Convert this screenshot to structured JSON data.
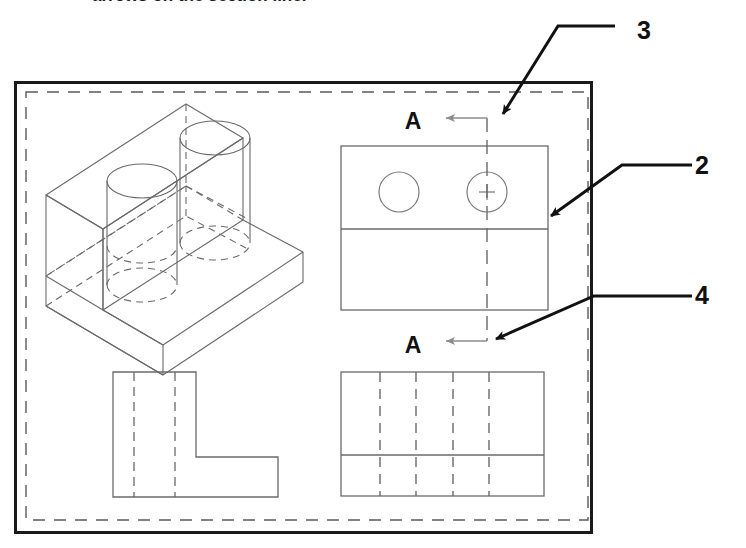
{
  "caption": {
    "text": "arrows on the section line."
  },
  "frame": {
    "outer": {
      "x": 14,
      "y": 81,
      "width": 578,
      "height": 452,
      "stroke": "#1a1a1a",
      "stroke_width": 3
    },
    "inner_dashed": {
      "x": 26,
      "y": 92,
      "width": 562,
      "height": 428,
      "stroke": "#555555",
      "stroke_width": 1.4,
      "dash": "11 9"
    }
  },
  "colors": {
    "heavy_line": "#111111",
    "thin_line": "#6a6a6a",
    "hidden_line": "#6a6a6a",
    "center_line": "#6a6a6a",
    "background": "#ffffff"
  },
  "callouts": [
    {
      "id": "callout-3",
      "label": "3",
      "label_x": 644,
      "label_y": 39,
      "horiz_x1": 615,
      "horiz_x2": 558,
      "horiz_y": 26,
      "diag_x": 499,
      "diag_y": 118,
      "arrow": "down-left"
    },
    {
      "id": "callout-2",
      "label": "2",
      "label_x": 700,
      "label_y": 172,
      "horiz_x1": 692,
      "horiz_x2": 622,
      "horiz_y": 165,
      "diag_x": 547,
      "diag_y": 219,
      "arrow": "down-left"
    },
    {
      "id": "callout-4",
      "label": "4",
      "label_x": 700,
      "label_y": 302,
      "horiz_x1": 692,
      "horiz_x2": 594,
      "horiz_y": 296,
      "diag_x": 492,
      "diag_y": 341,
      "arrow": "down-left"
    }
  ],
  "views": {
    "isometric": {
      "name": "isometric-pictorial-view",
      "description": "L-shaped bracket with two vertical through holes"
    },
    "top_view": {
      "name": "top-view-with-holes",
      "rect": {
        "x": 341,
        "y": 146,
        "width": 207,
        "height": 164
      },
      "divider_y": 229,
      "circles": [
        {
          "cx": 399,
          "cy": 192,
          "r": 20,
          "center_mark": false
        },
        {
          "cx": 487,
          "cy": 192,
          "r": 20,
          "center_mark": true
        }
      ]
    },
    "side_view": {
      "name": "l-shaped-side-view",
      "hidden_lines": 2
    },
    "front_view": {
      "name": "front-view-sectioned",
      "rect": {
        "x": 341,
        "y": 372,
        "width": 203,
        "height": 124
      },
      "divider_y": 455,
      "hidden_lines": 4
    }
  },
  "section": {
    "letter": "A",
    "top_label_x": 413,
    "top_label_y": 129,
    "bottom_label_x": 413,
    "bottom_label_y": 353,
    "line_x": 487,
    "line_top_y": 118,
    "line_bottom_y": 341,
    "arrow_tip_x": 444
  }
}
